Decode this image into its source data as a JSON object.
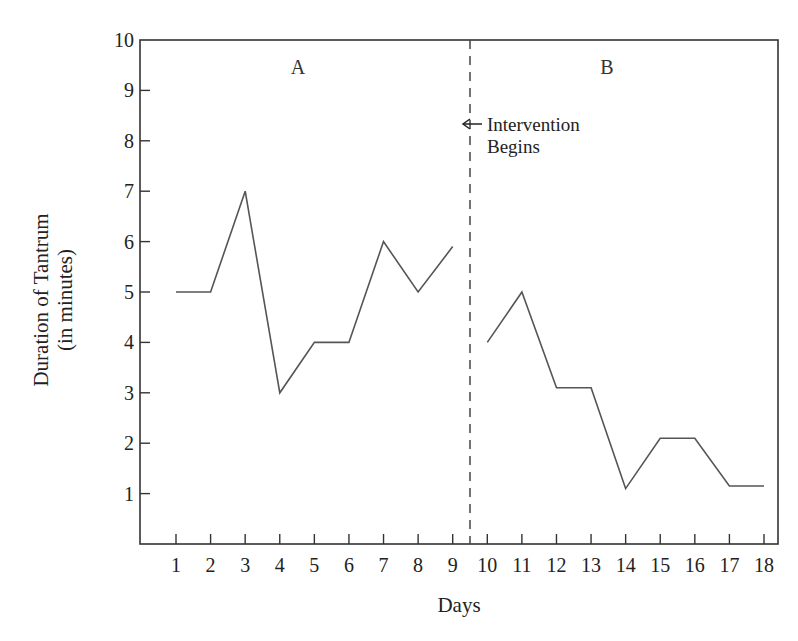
{
  "chart_data": {
    "type": "line",
    "title": "",
    "xlabel": "Days",
    "ylabel_line1": "Duration of Tantrum",
    "ylabel_line2": "(in minutes)",
    "xlim": [
      0.5,
      19
    ],
    "ylim": [
      0,
      10
    ],
    "x_ticks": [
      1,
      2,
      3,
      4,
      5,
      6,
      7,
      8,
      9,
      10,
      11,
      12,
      13,
      14,
      15,
      16,
      17,
      18
    ],
    "y_ticks": [
      1,
      2,
      3,
      4,
      5,
      6,
      7,
      8,
      9,
      10
    ],
    "grid": false,
    "legend": null,
    "phase_divider_x": 9.5,
    "phases": [
      {
        "label": "A",
        "name": "Baseline",
        "x": [
          1,
          2,
          3,
          4,
          5,
          6,
          7,
          8,
          9
        ],
        "values": [
          5,
          5,
          7,
          3,
          4,
          4,
          6,
          5,
          5.9
        ]
      },
      {
        "label": "B",
        "name": "Intervention",
        "x": [
          10,
          11,
          12,
          13,
          14,
          15,
          16,
          17,
          18
        ],
        "values": [
          4,
          5,
          3.1,
          3.1,
          1.1,
          2.1,
          2.1,
          1.15,
          1.15
        ]
      }
    ],
    "annotations": [
      {
        "text_line1": "Intervention",
        "text_line2": "Begins",
        "arrow": "left",
        "x": 9.5,
        "y": 8.2
      }
    ],
    "line_color": "#555555",
    "axis_color": "#333333"
  }
}
